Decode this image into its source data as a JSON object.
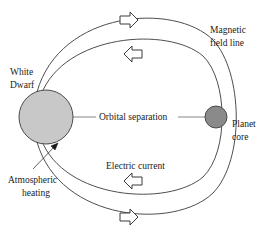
{
  "figure": {
    "background_color": "#ffffff",
    "stroke_color": "#3a3a3a"
  },
  "bodies": {
    "white_dwarf": {
      "label_line1": "White",
      "label_line2": "Dwarf",
      "fill_color": "#c8c8c8",
      "stroke_color": "#4a4a4a",
      "cx": 46,
      "cy": 117,
      "r": 27
    },
    "planet_core": {
      "label_line1": "Planet",
      "label_line2": "core",
      "fill_color": "#8a8a8a",
      "stroke_color": "#4a4a4a",
      "cx": 216,
      "cy": 117,
      "r": 11
    }
  },
  "annotations": {
    "magnetic_field_line_1": "Magnetic",
    "magnetic_field_line_2": "field line",
    "orbital_separation": "Orbital separation",
    "electric_current": "Electric current",
    "atmospheric_heating_1": "Atmospheric",
    "atmospheric_heating_2": "heating"
  },
  "flow_arrows": [
    {
      "name": "top-outer-arrow",
      "direction": "right",
      "x": 120,
      "y": 12
    },
    {
      "name": "top-inner-arrow",
      "direction": "left",
      "x": 124,
      "y": 48
    },
    {
      "name": "bottom-inner-arrow",
      "direction": "left",
      "x": 124,
      "y": 176
    },
    {
      "name": "bottom-outer-arrow",
      "direction": "right",
      "x": 120,
      "y": 211
    }
  ]
}
